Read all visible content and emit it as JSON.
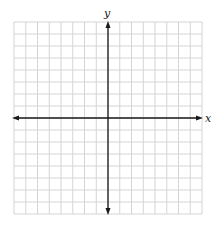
{
  "diagram": {
    "type": "coordinate-plane",
    "grid": {
      "columns": 16,
      "rows": 16,
      "left": 14,
      "top": 22,
      "cell_width": 11.75,
      "cell_height": 12,
      "line_color": "#d4d4d4"
    },
    "axes": {
      "color": "#1a1a1a",
      "origin_x": 108,
      "origin_y": 118,
      "x_label": "x",
      "y_label": "y"
    }
  }
}
